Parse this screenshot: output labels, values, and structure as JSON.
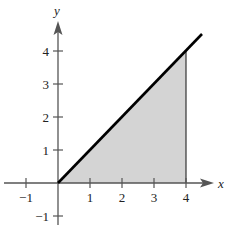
{
  "figure": {
    "axes": {
      "x_label": "x",
      "y_label": "y",
      "x_ticks": [
        {
          "value": -1,
          "label": "−1"
        },
        {
          "value": 1,
          "label": "1"
        },
        {
          "value": 2,
          "label": "2"
        },
        {
          "value": 3,
          "label": "3"
        },
        {
          "value": 4,
          "label": "4"
        }
      ],
      "y_ticks": [
        {
          "value": -1,
          "label": "−1"
        },
        {
          "value": 1,
          "label": "1"
        },
        {
          "value": 2,
          "label": "2"
        },
        {
          "value": 3,
          "label": "3"
        },
        {
          "value": 4,
          "label": "4"
        }
      ],
      "xlim": [
        -1.5,
        5
      ],
      "ylim": [
        -1.5,
        4.7
      ]
    },
    "curve": {
      "equation": "y = x",
      "x_start": 0,
      "x_end": 4.5,
      "color": "#000000"
    },
    "shaded_region": {
      "description": "region under y = x from x = 0 to x = 4",
      "x_from": 0,
      "x_to": 4,
      "fill": "#d4d4d4"
    },
    "colors": {
      "axis": "#555555",
      "line": "#000000",
      "shade": "#d4d4d4"
    }
  }
}
